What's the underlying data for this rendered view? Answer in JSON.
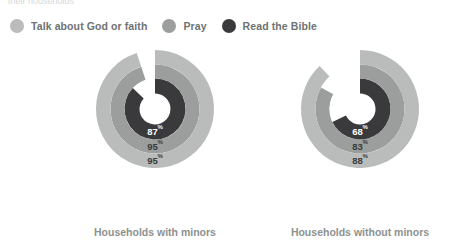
{
  "caption": {
    "top_text": "their households"
  },
  "legend": {
    "items": [
      {
        "label": "Talk about God or faith",
        "color": "#b9bcbb",
        "icon": "circle-swatch-icon"
      },
      {
        "label": "Pray",
        "color": "#9b9e9d",
        "icon": "circle-swatch-icon"
      },
      {
        "label": "Read the Bible",
        "color": "#3a3a3c",
        "icon": "circle-swatch-icon"
      }
    ]
  },
  "chart_data": {
    "type": "pie",
    "subtype": "nested-donut",
    "title": "",
    "xlabel": "",
    "ylabel": "",
    "legend_position": "top-left",
    "grid": false,
    "value_suffix": "%",
    "start_angle_deg": 0,
    "direction": "clockwise",
    "series": [
      {
        "name": "Talk about God or faith",
        "ring": "outer",
        "color": "#b9bcbb",
        "values": [
          95,
          88
        ]
      },
      {
        "name": "Pray",
        "ring": "middle",
        "color": "#9b9e9d",
        "values": [
          95,
          83
        ]
      },
      {
        "name": "Read the Bible",
        "ring": "inner",
        "color": "#3a3a3c",
        "values": [
          87,
          68
        ]
      }
    ],
    "categories": [
      "Households with minors",
      "Households without minors"
    ],
    "track_color": "#ffffff",
    "charts": [
      {
        "caption": "Households with minors",
        "rings": [
          {
            "series": "Talk about God or faith",
            "value": 95,
            "display": "95",
            "suffix": "%",
            "color": "#b9bcbb",
            "label_color": "#3a3a3c"
          },
          {
            "series": "Pray",
            "value": 95,
            "display": "95",
            "suffix": "%",
            "color": "#9b9e9d",
            "label_color": "#3a3a3c"
          },
          {
            "series": "Read the Bible",
            "value": 87,
            "display": "87",
            "suffix": "%",
            "color": "#3a3a3c",
            "label_color": "#ffffff"
          }
        ]
      },
      {
        "caption": "Households without minors",
        "rings": [
          {
            "series": "Talk about God or faith",
            "value": 88,
            "display": "88",
            "suffix": "%",
            "color": "#b9bcbb",
            "label_color": "#3a3a3c"
          },
          {
            "series": "Pray",
            "value": 83,
            "display": "83",
            "suffix": "%",
            "color": "#9b9e9d",
            "label_color": "#3a3a3c"
          },
          {
            "series": "Read the Bible",
            "value": 68,
            "display": "68",
            "suffix": "%",
            "color": "#3a3a3c",
            "label_color": "#ffffff"
          }
        ]
      }
    ]
  }
}
